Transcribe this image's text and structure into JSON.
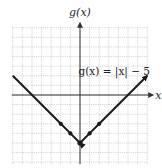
{
  "chart_data": {
    "type": "line",
    "title": "",
    "equation_label": "g(x) = |x| − 5",
    "xlabel": "x",
    "ylabel": "g(x)",
    "xlim": [
      -7,
      7
    ],
    "ylim": [
      -7,
      7
    ],
    "grid": true,
    "series": [
      {
        "name": "g(x) = |x| − 5",
        "x": [
          -7,
          -2,
          -1,
          0,
          1,
          2,
          7
        ],
        "y": [
          2,
          -3,
          -4,
          -5,
          -4,
          -3,
          2
        ]
      }
    ],
    "marked_points": [
      [
        -2,
        -3
      ],
      [
        -1,
        -4
      ],
      [
        0,
        -5
      ],
      [
        1,
        -4
      ],
      [
        2,
        -3
      ]
    ],
    "arrows_on_ends": true,
    "colors": {
      "curve": "#1a1a1a",
      "grid": "#b8b8b8",
      "axis": "#333333"
    }
  }
}
